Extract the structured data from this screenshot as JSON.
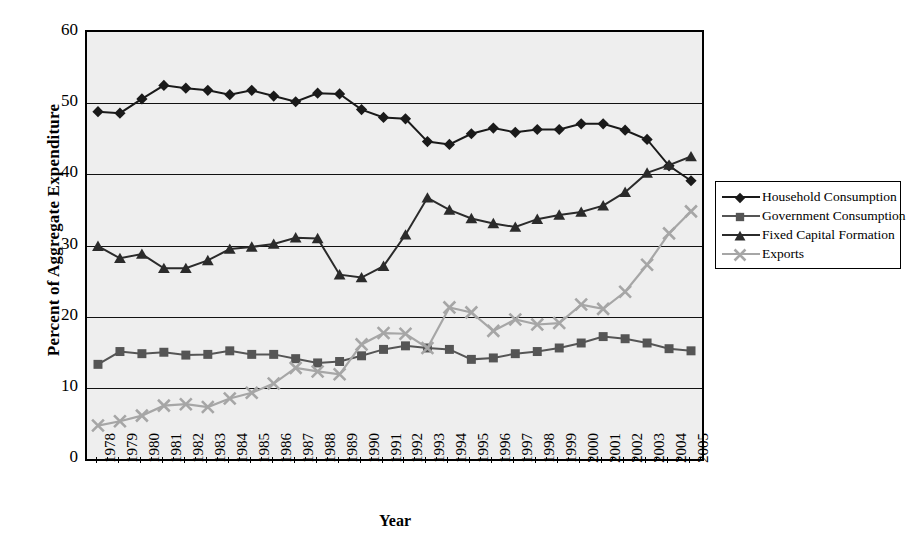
{
  "chart_data": {
    "type": "line",
    "title": "",
    "xlabel": "Year",
    "ylabel": "Percent of Aggregate Expenditure",
    "ylim": [
      0,
      60
    ],
    "yticks": [
      0,
      10,
      20,
      30,
      40,
      50,
      60
    ],
    "grid": true,
    "legend_position": "right",
    "categories": [
      "1978",
      "1979",
      "1980",
      "1981",
      "1982",
      "1983",
      "1984",
      "1985",
      "1986",
      "1987",
      "1988",
      "1989",
      "1990",
      "1991",
      "1992",
      "1993",
      "1994",
      "1995",
      "1996",
      "1997",
      "1998",
      "1999",
      "2000",
      "2001",
      "2002",
      "2003",
      "2004",
      "2005"
    ],
    "series": [
      {
        "name": "Household Consumption",
        "marker": "diamond",
        "color": "#1a1a1a",
        "values": [
          48.8,
          48.6,
          50.6,
          52.5,
          52.1,
          51.8,
          51.2,
          51.8,
          51.0,
          50.2,
          51.4,
          51.3,
          49.1,
          48.0,
          47.8,
          44.6,
          44.2,
          45.7,
          46.5,
          45.9,
          46.3,
          46.3,
          47.1,
          47.1,
          46.2,
          44.9,
          41.2,
          39.1
        ]
      },
      {
        "name": "Government Consumption",
        "marker": "square",
        "color": "#555555",
        "values": [
          13.3,
          15.1,
          14.8,
          15.0,
          14.6,
          14.7,
          15.2,
          14.7,
          14.7,
          14.1,
          13.5,
          13.7,
          14.5,
          15.4,
          15.9,
          15.6,
          15.4,
          14.0,
          14.2,
          14.8,
          15.1,
          15.6,
          16.3,
          17.2,
          16.9,
          16.3,
          15.5,
          15.2
        ]
      },
      {
        "name": "Fixed Capital Formation",
        "marker": "triangle",
        "color": "#2b2b2b",
        "values": [
          29.9,
          28.2,
          28.8,
          26.8,
          26.8,
          27.9,
          29.5,
          29.8,
          30.2,
          31.1,
          31.0,
          25.9,
          25.5,
          27.1,
          31.5,
          36.7,
          35.0,
          33.8,
          33.1,
          32.6,
          33.7,
          34.3,
          34.7,
          35.6,
          37.5,
          40.2,
          41.3,
          42.5
        ]
      },
      {
        "name": "Exports",
        "marker": "cross",
        "color": "#a6a6a6",
        "values": [
          4.7,
          5.3,
          6.1,
          7.5,
          7.7,
          7.3,
          8.5,
          9.3,
          10.6,
          12.8,
          12.3,
          11.9,
          16.1,
          17.7,
          17.6,
          15.6,
          21.3,
          20.6,
          18.0,
          19.6,
          18.9,
          19.1,
          21.7,
          21.1,
          23.5,
          27.3,
          31.7,
          34.8
        ]
      }
    ]
  },
  "legend": {
    "items": [
      {
        "label": "Household Consumption"
      },
      {
        "label": "Government Consumption"
      },
      {
        "label": "Fixed Capital Formation"
      },
      {
        "label": "Exports"
      }
    ]
  },
  "axes": {
    "y_title": "Percent of Aggregate Expenditure",
    "x_title": "Year"
  }
}
